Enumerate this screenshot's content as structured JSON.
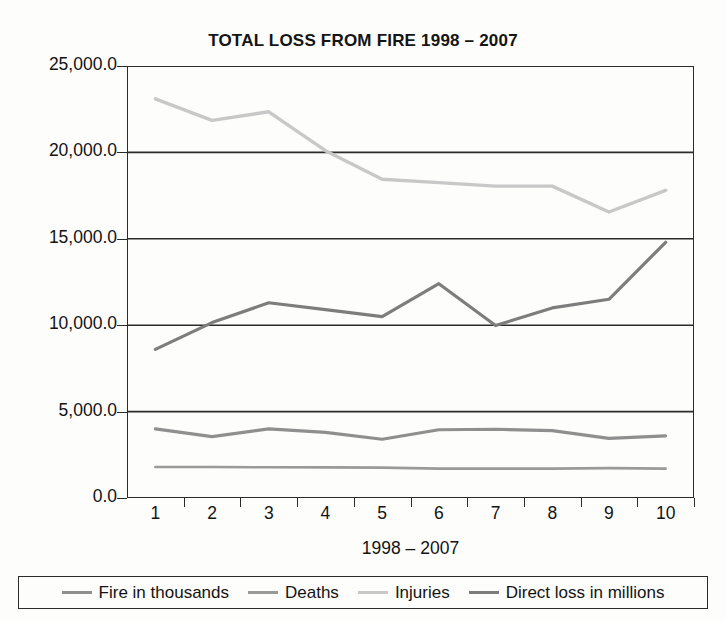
{
  "chart_data": {
    "type": "line",
    "title": "TOTAL LOSS FROM FIRE 1998 – 2007",
    "xlabel": "1998 – 2007",
    "ylabel": "",
    "categories": [
      "1",
      "2",
      "3",
      "4",
      "5",
      "6",
      "7",
      "8",
      "9",
      "10"
    ],
    "x": [
      1,
      2,
      3,
      4,
      5,
      6,
      7,
      8,
      9,
      10
    ],
    "ylim": [
      0,
      25000
    ],
    "yticks": [
      0,
      5000,
      10000,
      15000,
      20000,
      25000
    ],
    "ytick_labels": [
      "0.0",
      "5,000.0",
      "10,000.0",
      "15,000.0",
      "20,000.0",
      "25,000.0"
    ],
    "grid": "horizontal",
    "legend_position": "bottom",
    "series": [
      {
        "name": "Fire in thousands",
        "color": "#8f8f8f",
        "width": 3.2,
        "values": [
          4000,
          3550,
          4000,
          3800,
          3400,
          3950,
          3980,
          3900,
          3450,
          3600
        ]
      },
      {
        "name": "Deaths",
        "color": "#9a9a9a",
        "width": 2.6,
        "values": [
          1790,
          1790,
          1780,
          1770,
          1760,
          1700,
          1700,
          1700,
          1730,
          1700
        ]
      },
      {
        "name": "Injuries",
        "color": "#c8c8c8",
        "width": 3.4,
        "values": [
          23100,
          21850,
          22350,
          20100,
          18450,
          18250,
          18050,
          18050,
          16550,
          17800
        ]
      },
      {
        "name": "Direct loss in millions",
        "color": "#7d7d7d",
        "width": 3.2,
        "values": [
          8600,
          10150,
          11300,
          10900,
          10500,
          12400,
          9980,
          11000,
          11500,
          14800
        ]
      }
    ]
  },
  "legend": {
    "items": [
      {
        "label": "Fire in thousands"
      },
      {
        "label": "Deaths"
      },
      {
        "label": "Injuries"
      },
      {
        "label": "Direct loss in millions"
      }
    ]
  }
}
